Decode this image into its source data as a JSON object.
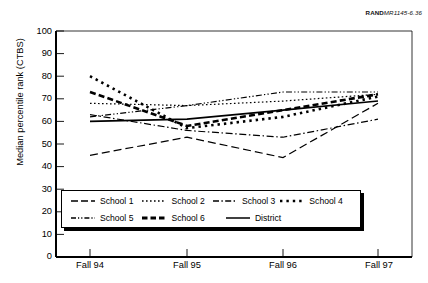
{
  "source_id": {
    "bold": "RAND",
    "rest": "MR1145-6.36"
  },
  "axes": {
    "ylabel": "Median percentile rank (CTBS)",
    "yticks": [
      0,
      10,
      20,
      30,
      40,
      50,
      60,
      70,
      80,
      90,
      100
    ],
    "xticks": [
      "Fall 94",
      "Fall 95",
      "Fall 96",
      "Fall 97"
    ]
  },
  "legend": {
    "row1": [
      "School 1",
      "School 2",
      "School 3",
      "School 4"
    ],
    "row2": [
      "School 5",
      "School 6",
      "District"
    ]
  },
  "chart_data": {
    "type": "line",
    "title": "",
    "xlabel": "",
    "ylabel": "Median percentile rank (CTBS)",
    "categories": [
      "Fall 94",
      "Fall 95",
      "Fall 96",
      "Fall 97"
    ],
    "ylim": [
      0,
      100
    ],
    "ytick_step": 10,
    "grid": false,
    "legend_position": "inside-bottom-left",
    "series": [
      {
        "name": "School 1",
        "style": "long-dash",
        "width": 1.2,
        "values": [
          45,
          53,
          44,
          68
        ]
      },
      {
        "name": "School 2",
        "style": "fine-dotted",
        "width": 1.2,
        "values": [
          68,
          67,
          69,
          72
        ]
      },
      {
        "name": "School 3",
        "style": "dash-dot",
        "width": 1.2,
        "values": [
          63,
          56,
          53,
          61
        ]
      },
      {
        "name": "School 4",
        "style": "square-dots",
        "width": 2.6,
        "values": [
          80,
          57,
          62,
          71
        ]
      },
      {
        "name": "School 5",
        "style": "dash-dot-dot",
        "width": 1.2,
        "values": [
          62,
          67,
          73,
          73
        ]
      },
      {
        "name": "School 6",
        "style": "thick-dash",
        "width": 2.6,
        "values": [
          73,
          58,
          65,
          72
        ]
      },
      {
        "name": "District",
        "style": "solid",
        "width": 1.6,
        "values": [
          60,
          61,
          65,
          69
        ]
      }
    ]
  }
}
